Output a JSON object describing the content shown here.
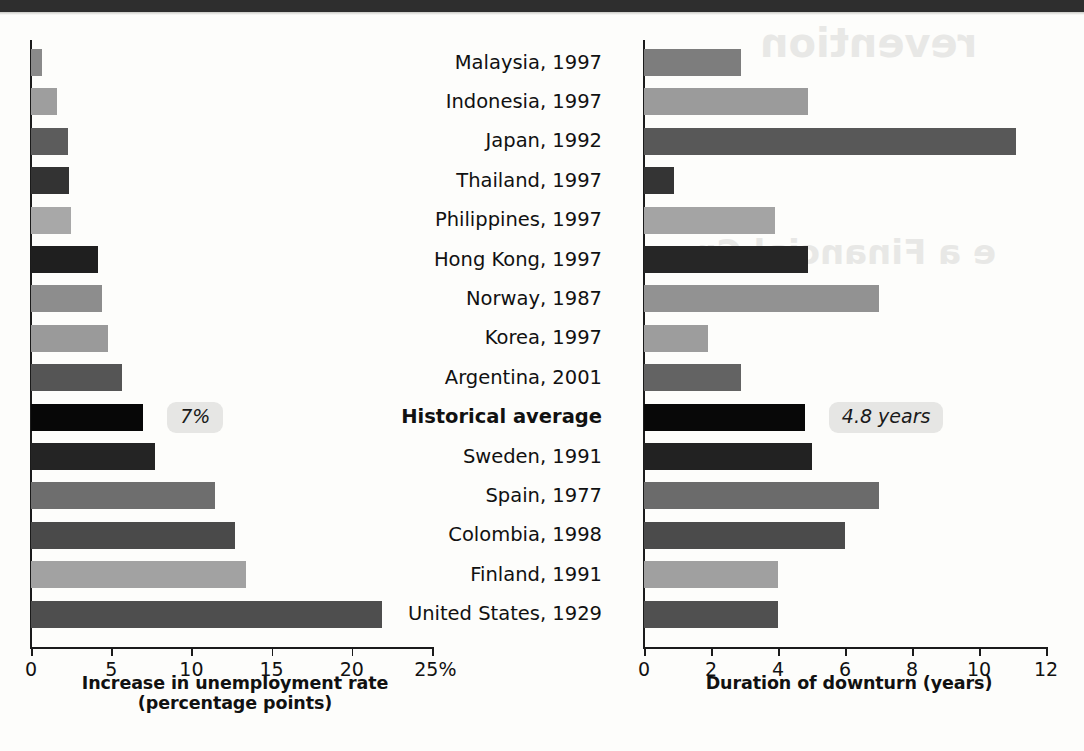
{
  "page": {
    "background_color": "#fdfdfb",
    "top_band_color": "#2e2e2e"
  },
  "ghost_text": [
    {
      "text": "revention",
      "x": 760,
      "y": 20,
      "size": 40
    },
    {
      "text": "e a Financial Cr",
      "x": 700,
      "y": 232,
      "size": 34
    }
  ],
  "chart_data": {
    "type": "bar",
    "orientation": "horizontal",
    "title": "",
    "categories": [
      "Malaysia, 1997",
      "Indonesia, 1997",
      "Japan, 1992",
      "Thailand, 1997",
      "Philippines, 1997",
      "Hong Kong, 1997",
      "Norway, 1987",
      "Korea, 1997",
      "Argentina, 2001",
      "Historical average",
      "Sweden, 1991",
      "Spain, 1977",
      "Colombia, 1998",
      "Finland, 1991",
      "United States, 1929"
    ],
    "highlight_category": "Historical average",
    "panels": [
      {
        "id": "left",
        "xlabel_line1": "Increase in unemployment rate",
        "xlabel_line2": "(percentage points)",
        "ylabel": "",
        "xlim": [
          0,
          25
        ],
        "ticks": [
          0,
          5,
          10,
          15,
          20,
          25
        ],
        "tick_labels": [
          "0",
          "5",
          "10",
          "15",
          "20",
          "25%"
        ],
        "unit": "percentage points",
        "grid": false,
        "values": [
          0.7,
          1.6,
          2.3,
          2.4,
          2.5,
          4.2,
          4.4,
          4.8,
          5.7,
          7.0,
          7.7,
          11.5,
          12.7,
          13.4,
          21.9
        ],
        "colors": [
          "#8a8a8a",
          "#9e9e9e",
          "#5c5c5c",
          "#333333",
          "#a8a8a8",
          "#1f1f1f",
          "#8d8d8d",
          "#9a9a9a",
          "#555555",
          "#070707",
          "#242424",
          "#6e6e6e",
          "#4a4a4a",
          "#a2a2a2",
          "#4e4e4e"
        ],
        "callout": {
          "text": "7%",
          "category": "Historical average",
          "value": 7.0
        }
      },
      {
        "id": "right",
        "xlabel_line1": "Duration of downturn (years)",
        "xlabel_line2": "",
        "ylabel": "",
        "xlim": [
          0,
          12
        ],
        "ticks": [
          0,
          2,
          4,
          6,
          8,
          10,
          12
        ],
        "tick_labels": [
          "0",
          "2",
          "4",
          "6",
          "8",
          "10",
          "12"
        ],
        "unit": "years",
        "grid": false,
        "values": [
          2.9,
          4.9,
          11.1,
          0.9,
          3.9,
          4.9,
          7.0,
          1.9,
          2.9,
          4.8,
          5.0,
          7.0,
          6.0,
          4.0,
          4.0
        ],
        "colors": [
          "#7d7d7d",
          "#9b9b9b",
          "#585858",
          "#343434",
          "#a4a4a4",
          "#262626",
          "#929292",
          "#9d9d9d",
          "#636363",
          "#080808",
          "#222222",
          "#6b6b6b",
          "#4b4b4b",
          "#a0a0a0",
          "#505050"
        ],
        "callout": {
          "text": "4.8 years",
          "category": "Historical average",
          "value": 4.8
        }
      }
    ]
  }
}
